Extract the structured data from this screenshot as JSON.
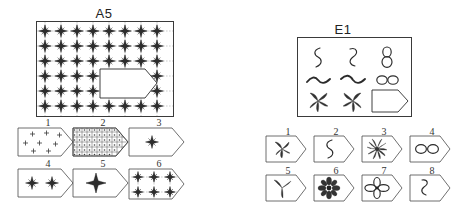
{
  "page": {
    "kind": "nonverbal-reasoning-test-plate",
    "width": 446,
    "height": 207,
    "background_color": "#ffffff",
    "ink_color": "#2b2b2b"
  },
  "items": [
    {
      "id": "A5",
      "label": "A5",
      "type": "pattern-completion",
      "matrix": {
        "description": "Large rectangular field filled with a regular lattice of four-pointed stars on a faint dashed grid; a tag-shaped piece is missing from the lower right region.",
        "grid_columns": 8,
        "grid_rows": 6,
        "motif": "four-pointed-star",
        "gridlines": true,
        "missing_piece_shape": "tag"
      },
      "options": [
        {
          "number": "1",
          "content": "six small plus signs scattered, no gridlines"
        },
        {
          "number": "2",
          "content": "dense small square grid with a dot in each cell"
        },
        {
          "number": "3",
          "content": "one four-pointed star centred, no gridlines"
        },
        {
          "number": "4",
          "content": "two four-pointed stars side by side, no gridlines"
        },
        {
          "number": "5",
          "content": "one large four-pointed star centred, no gridlines"
        },
        {
          "number": "6",
          "content": "two rows of three four-pointed stars on dashed gridlines"
        }
      ]
    },
    {
      "id": "E1",
      "label": "E1",
      "type": "pattern-completion",
      "matrix": {
        "description": "Three-by-three matrix of line figures; the bottom-right cell is an empty tag-shaped blank.",
        "rows": [
          [
            "vertical s-curve",
            "vertical zigzag curve",
            "vertical figure-eight"
          ],
          [
            "horizontal wave",
            "horizontal wave mirrored",
            "horizontal infinity"
          ],
          [
            "four-blade pinwheel",
            "four-blade pinwheel mirrored",
            "missing-piece tag"
          ]
        ],
        "missing_piece_shape": "tag"
      },
      "options": [
        {
          "number": "1",
          "content": "four-blade pinwheel"
        },
        {
          "number": "2",
          "content": "vertical s-curve"
        },
        {
          "number": "3",
          "content": "many-blade starburst pinwheel"
        },
        {
          "number": "4",
          "content": "horizontal infinity"
        },
        {
          "number": "5",
          "content": "three-blade pinwheel"
        },
        {
          "number": "6",
          "content": "eight-petal rosette flower"
        },
        {
          "number": "7",
          "content": "four-petal flower"
        },
        {
          "number": "8",
          "content": "vertical zigzag curve"
        }
      ]
    }
  ]
}
